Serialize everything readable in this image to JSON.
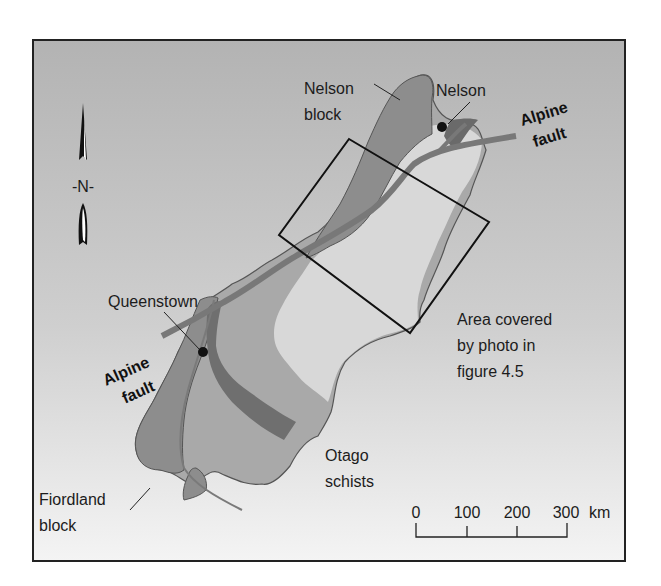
{
  "map": {
    "title": "Alpine fault, South Island, New Zealand",
    "colors": {
      "background_top": "#b3b3b3",
      "background_bottom": "#f3f3f3",
      "frame": "#222222",
      "nelson_block": "#8f8f8f",
      "fiordland_block": "#8f8f8f",
      "middle_terrane": "#a9a9a9",
      "otago_schists": "#d9d9d9",
      "dark_band": "#6f6f6f",
      "alpine_fault": "#7a7a7a",
      "study_box": "#111111",
      "city_dot": "#111111"
    },
    "north_arrow": {
      "label": "-N-"
    },
    "labels": {
      "nelson_block_line1": "Nelson",
      "nelson_block_line2": "block",
      "nelson_city": "Nelson",
      "alpine_fault_ne_line1": "Alpine",
      "alpine_fault_ne_line2": "fault",
      "queenstown": "Queenstown",
      "alpine_fault_sw_line1": "Alpine",
      "alpine_fault_sw_line2": "fault",
      "area_line1": "Area covered",
      "area_line2": "by photo in",
      "area_line3": "figure 4.5",
      "otago_line1": "Otago",
      "otago_line2": "schists",
      "fiordland_line1": "Fiordland",
      "fiordland_line2": "block"
    },
    "scale_bar": {
      "ticks": [
        "0",
        "100",
        "200",
        "300"
      ],
      "unit": "km"
    }
  }
}
